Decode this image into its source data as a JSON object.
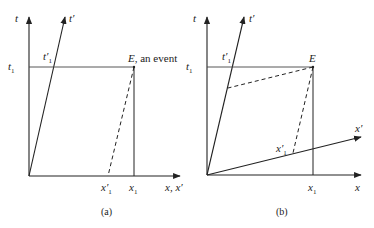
{
  "figure_a": {
    "caption": "(a)",
    "labels": {
      "t_axis": "t",
      "t_prime_axis": "t′",
      "t1": "t",
      "t1_sub": "1",
      "t1_prime": "t′",
      "t1_prime_sub": "1",
      "event_E": "E",
      "event_text": ", an event",
      "x1_prime": "x′",
      "x1_prime_sub": "1",
      "x1": "x",
      "x1_sub": "1",
      "x_axis": "x, x′"
    }
  },
  "figure_b": {
    "caption": "(b)",
    "labels": {
      "t_axis": "t",
      "t_prime_axis": "t′",
      "t1": "t",
      "t1_sub": "1",
      "t1_prime": "t′",
      "t1_prime_sub": "1",
      "event_E": "E",
      "x_prime_axis": "x′",
      "x1_prime": "x′",
      "x1_prime_sub": "1",
      "x1": "x",
      "x1_sub": "1",
      "x_axis": "x"
    }
  }
}
